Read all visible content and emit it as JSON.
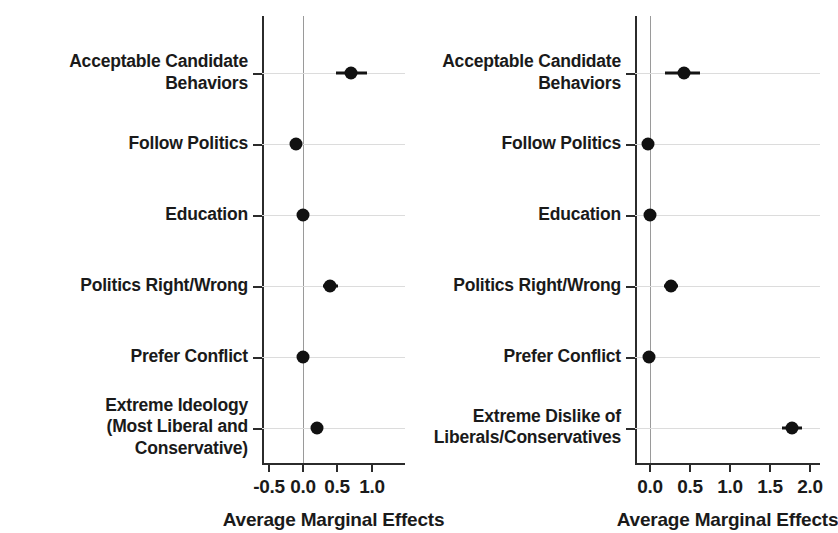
{
  "figure": {
    "background": "#ffffff",
    "point_color": "#111111",
    "axis_color": "#2b2b2b",
    "grid_color": "#dcdcdc",
    "zero_line_color": "#9a9a9a"
  },
  "chart_data": [
    {
      "panel": "left",
      "type": "scatter",
      "title": "",
      "xlabel": "Average Marginal Effects",
      "ylabel": "",
      "xlim": [
        -0.75,
        1.25
      ],
      "xticks": [
        -0.5,
        0.0,
        0.5,
        1.0
      ],
      "xticklabels": [
        "-0.5",
        "0.0",
        "0.5",
        "1.0"
      ],
      "grid": true,
      "legend": "none",
      "zero_reference_line": 0.0,
      "categories": [
        "Acceptable Candidate\nBehaviors",
        "Follow Politics",
        "Education",
        "Politics Right/Wrong",
        "Prefer Conflict",
        "Extreme Ideology\n(Most Liberal and Conservative)"
      ],
      "values": [
        0.7,
        -0.1,
        0.0,
        0.4,
        0.0,
        0.2
      ],
      "ci_low": [
        0.48,
        -0.19,
        -0.06,
        0.29,
        -0.05,
        0.12
      ],
      "ci_high": [
        0.94,
        -0.02,
        0.06,
        0.52,
        0.05,
        0.3
      ]
    },
    {
      "panel": "right",
      "type": "scatter",
      "title": "",
      "xlabel": "Average Marginal Effects",
      "ylabel": "",
      "xlim": [
        -0.2,
        2.2
      ],
      "xticks": [
        0.0,
        0.5,
        1.0,
        1.5,
        2.0
      ],
      "xticklabels": [
        "0.0",
        "0.5",
        "1.0",
        "1.5",
        "2.0"
      ],
      "grid": true,
      "legend": "none",
      "zero_reference_line": 0.0,
      "categories": [
        "Acceptable Candidate\nBehaviors",
        "Follow Politics",
        "Education",
        "Politics Right/Wrong",
        "Prefer Conflict",
        "Extreme Dislike of\nLiberals/Conservatives"
      ],
      "values": [
        0.43,
        -0.02,
        0.0,
        0.26,
        -0.01,
        1.77
      ],
      "ci_low": [
        0.19,
        -0.05,
        -0.03,
        0.17,
        -0.04,
        1.65
      ],
      "ci_high": [
        0.63,
        0.02,
        0.04,
        0.35,
        0.03,
        1.9
      ]
    }
  ],
  "panels": {
    "left": {
      "axis_title": "Average Marginal Effects",
      "tick_labels": [
        "-0.5",
        "0.0",
        "0.5",
        "1.0"
      ],
      "category_labels": [
        "Acceptable Candidate\nBehaviors",
        "Follow Politics",
        "Education",
        "Politics Right/Wrong",
        "Prefer Conflict",
        "Extreme Ideology\n(Most Liberal and Conservative)"
      ]
    },
    "right": {
      "axis_title": "Average Marginal Effects",
      "tick_labels": [
        "0.0",
        "0.5",
        "1.0",
        "1.5",
        "2.0"
      ],
      "category_labels": [
        "Acceptable Candidate\nBehaviors",
        "Follow Politics",
        "Education",
        "Politics Right/Wrong",
        "Prefer Conflict",
        "Extreme Dislike of\nLiberals/Conservatives"
      ]
    }
  }
}
